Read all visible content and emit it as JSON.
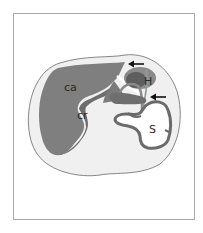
{
  "diagram": {
    "type": "anatomical cross-section",
    "labels": {
      "ca": "ca",
      "cr": "cr",
      "H": "H",
      "S": "S"
    },
    "arrows": [
      {
        "name": "upper-arrow",
        "direction": "left",
        "points_to": "junction above H"
      },
      {
        "name": "lower-arrow",
        "direction": "left",
        "points_to": "junction below H"
      }
    ],
    "colors": {
      "body_fill": "#f0f0f0",
      "body_stroke": "#6a6a6a",
      "liver_fill": "#7f7f7f",
      "liver_dark": "#6e6e6e",
      "H_fill": "#5e5e5e",
      "H_outer": "#8a8a8a",
      "S_wall": "#6a6a6a",
      "frame_border": "#a9a9a9"
    }
  }
}
